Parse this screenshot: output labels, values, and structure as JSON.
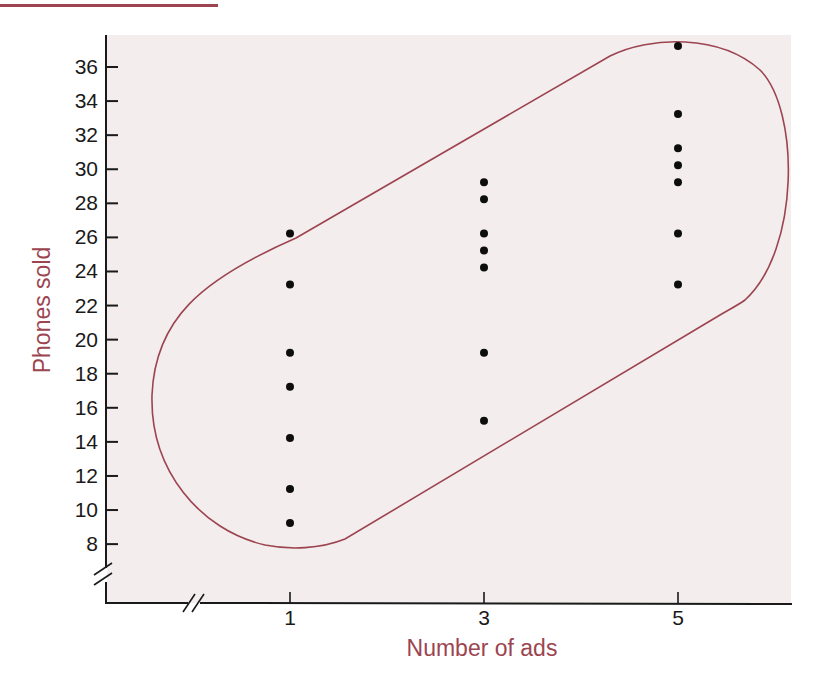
{
  "colors": {
    "accent": "#9c4450",
    "plot_background": "#f3eded",
    "axis": "#1a1a1a",
    "points": "#0d0d0d"
  },
  "chart_data": {
    "type": "scatter",
    "title": "",
    "xlabel": "Number of ads",
    "ylabel": "Phones sold",
    "x_ticks": [
      1,
      3,
      5
    ],
    "y_ticks": [
      8,
      10,
      12,
      14,
      16,
      18,
      20,
      22,
      24,
      26,
      28,
      30,
      32,
      34,
      36
    ],
    "xlim": [
      0,
      6
    ],
    "ylim": [
      6,
      38
    ],
    "axis_breaks": {
      "x": true,
      "y": true
    },
    "grid": false,
    "legend": null,
    "annotations": [
      "Stadium-shaped outline enclosing all points, trending upward left to right"
    ],
    "series": [
      {
        "name": "Observations",
        "points": [
          {
            "x": 1,
            "y": 26
          },
          {
            "x": 1,
            "y": 23
          },
          {
            "x": 1,
            "y": 19
          },
          {
            "x": 1,
            "y": 17
          },
          {
            "x": 1,
            "y": 14
          },
          {
            "x": 1,
            "y": 11
          },
          {
            "x": 1,
            "y": 9
          },
          {
            "x": 3,
            "y": 29
          },
          {
            "x": 3,
            "y": 28
          },
          {
            "x": 3,
            "y": 26
          },
          {
            "x": 3,
            "y": 25
          },
          {
            "x": 3,
            "y": 24
          },
          {
            "x": 3,
            "y": 19
          },
          {
            "x": 3,
            "y": 15
          },
          {
            "x": 5,
            "y": 37
          },
          {
            "x": 5,
            "y": 33
          },
          {
            "x": 5,
            "y": 31
          },
          {
            "x": 5,
            "y": 30
          },
          {
            "x": 5,
            "y": 29
          },
          {
            "x": 5,
            "y": 26
          },
          {
            "x": 5,
            "y": 23
          }
        ]
      }
    ]
  }
}
